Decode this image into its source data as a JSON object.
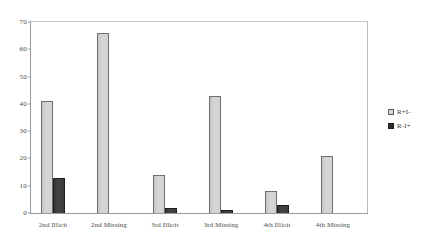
{
  "chart_data": {
    "type": "bar",
    "title": "",
    "subtitle": "",
    "xlabel": "",
    "ylabel": "",
    "ylim": [
      0,
      70
    ],
    "yticks": [
      0,
      10,
      20,
      30,
      40,
      50,
      60,
      70
    ],
    "ytick_labels": [
      "0",
      "10",
      "20",
      "30",
      "40",
      "50",
      "60",
      "70"
    ],
    "grid": false,
    "legend_position": "right",
    "categories": [
      "2nd Illicit",
      "2nd Missing",
      "3rd Illicit",
      "3rd Missing",
      "4th Illicit",
      "4th Missing"
    ],
    "series": [
      {
        "name": "R+I-",
        "color": "#d2d2d2",
        "values": [
          41,
          66,
          14,
          43,
          8,
          21
        ]
      },
      {
        "name": "R-I+",
        "color": "#3a3a3a",
        "values": [
          13,
          0,
          2,
          1,
          3,
          0
        ]
      }
    ]
  },
  "legend": {
    "items": [
      {
        "label": "R+I-"
      },
      {
        "label": "R-I+"
      }
    ]
  }
}
